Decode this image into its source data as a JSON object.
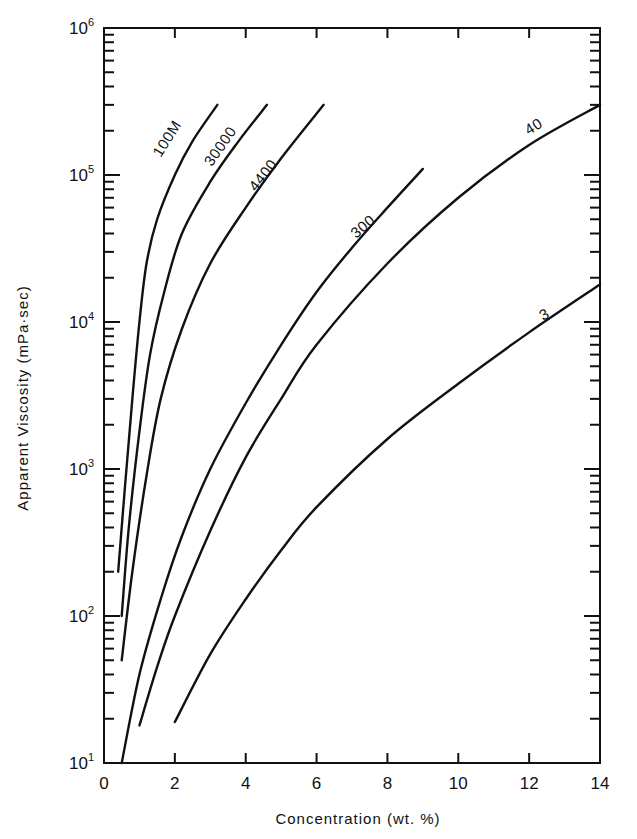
{
  "chart_data": {
    "type": "line",
    "title": "",
    "xlabel": "Concentration (wt. %)",
    "ylabel": "Apparent Viscosity (mPa·sec)",
    "xlim": [
      0,
      14
    ],
    "ylim": [
      10,
      1000000
    ],
    "yscale": "log",
    "grid": false,
    "legend": "inline curve labels",
    "x_ticks": [
      0,
      2,
      4,
      6,
      8,
      10,
      12,
      14
    ],
    "y_ticks": [
      {
        "base": "10",
        "exp": "1"
      },
      {
        "base": "10",
        "exp": "2"
      },
      {
        "base": "10",
        "exp": "3"
      },
      {
        "base": "10",
        "exp": "4"
      },
      {
        "base": "10",
        "exp": "5"
      },
      {
        "base": "10",
        "exp": "6"
      }
    ],
    "series": [
      {
        "name": "100M",
        "x": [
          0.4,
          0.6,
          0.8,
          1.0,
          1.2,
          1.5,
          2.0,
          2.5,
          3.2
        ],
        "values": [
          200,
          800,
          3000,
          10000,
          25000,
          50000,
          100000,
          170000,
          300000
        ]
      },
      {
        "name": "30000",
        "x": [
          0.5,
          0.7,
          1.0,
          1.3,
          1.7,
          2.2,
          3.0,
          3.8,
          4.6
        ],
        "values": [
          100,
          400,
          1800,
          6000,
          16000,
          40000,
          90000,
          170000,
          300000
        ]
      },
      {
        "name": "4400",
        "x": [
          0.5,
          0.8,
          1.2,
          1.6,
          2.2,
          3.0,
          4.0,
          5.0,
          6.2
        ],
        "values": [
          50,
          200,
          900,
          3000,
          9000,
          25000,
          60000,
          130000,
          300000
        ]
      },
      {
        "name": "300",
        "x": [
          0.5,
          1.0,
          1.6,
          2.2,
          3.0,
          4.0,
          5.0,
          6.0,
          7.0,
          8.0,
          9.0
        ],
        "values": [
          10,
          40,
          130,
          350,
          1000,
          2800,
          7000,
          16000,
          32000,
          60000,
          110000
        ]
      },
      {
        "name": "40",
        "x": [
          1.0,
          1.5,
          2.0,
          3.0,
          4.0,
          5.0,
          6.0,
          8.0,
          10.0,
          12.0,
          14.0
        ],
        "values": [
          18,
          45,
          100,
          380,
          1200,
          3000,
          7000,
          25000,
          70000,
          160000,
          300000
        ]
      },
      {
        "name": "3",
        "x": [
          2.0,
          3.0,
          4.0,
          5.0,
          6.0,
          8.0,
          10.0,
          12.0,
          14.0
        ],
        "values": [
          19,
          55,
          130,
          280,
          550,
          1600,
          3800,
          8500,
          18000
        ]
      }
    ]
  }
}
